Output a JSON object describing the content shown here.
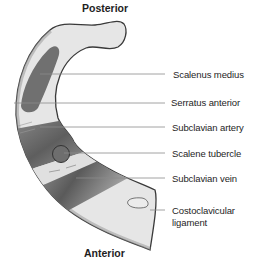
{
  "diagram": {
    "orientation": {
      "top": "Posterior",
      "bottom": "Anterior"
    },
    "labels": [
      {
        "id": "scalenus-medius",
        "text": "Scalenus medius"
      },
      {
        "id": "serratus-anterior",
        "text": "Serratus anterior"
      },
      {
        "id": "subclavian-artery",
        "text": "Subclavian artery"
      },
      {
        "id": "scalene-tubercle",
        "text": "Scalene tubercle"
      },
      {
        "id": "subclavian-vein",
        "text": "Subclavian vein"
      },
      {
        "id": "costoclavicular-ligament",
        "text": "Costoclavicular",
        "text2": "ligament"
      }
    ],
    "colors": {
      "bone_fill": "#e6e6e6",
      "bone_outline": "#3a3a3a",
      "muscle_dark": "#707070",
      "groove_gradient_dark": "#6a6a6a",
      "groove_gradient_light": "#d8d8d8",
      "leader_line": "#8a8a8a",
      "text": "#1e1e1e"
    }
  }
}
